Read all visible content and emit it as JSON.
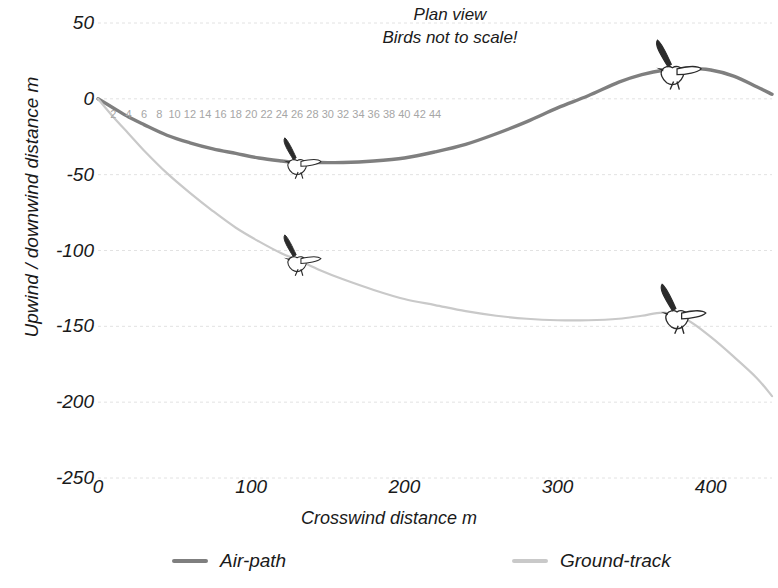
{
  "titles": {
    "line1": "Plan view",
    "line2": "Birds not to scale!"
  },
  "axes": {
    "ylabel": "Upwind / downwind distance   m",
    "xlabel": "Crosswind distance   m",
    "yticks": [
      "50",
      "0",
      "-50",
      "-100",
      "-150",
      "-200",
      "-250"
    ],
    "xticks": [
      "0",
      "100",
      "200",
      "300",
      "400"
    ],
    "secondary_xticks": [
      "2",
      "4",
      "6",
      "8",
      "10",
      "12",
      "14",
      "16",
      "18",
      "20",
      "22",
      "24",
      "26",
      "28",
      "30",
      "32",
      "34",
      "36",
      "38",
      "40",
      "42",
      "44"
    ]
  },
  "legend": {
    "air_label": "Air-path",
    "ground_label": "Ground-track"
  },
  "colors": {
    "air_path": "#7f7f7f",
    "ground_track": "#c9c9c9",
    "grid": "#e2e2e2",
    "text": "#1a1a1a",
    "secondary_tick": "#a6a6a6"
  },
  "chart_data": {
    "type": "line",
    "title": "Plan view",
    "subtitle": "Birds not to scale!",
    "xlabel": "Crosswind distance   m",
    "ylabel": "Upwind / downwind distance   m",
    "xlim": [
      0,
      440
    ],
    "ylim": [
      -250,
      50
    ],
    "xticks": [
      0,
      100,
      200,
      300,
      400
    ],
    "yticks": [
      50,
      0,
      -50,
      -100,
      -150,
      -200,
      -250
    ],
    "secondary_x_axis": {
      "label": "",
      "ticks": [
        2,
        4,
        6,
        8,
        10,
        12,
        14,
        16,
        18,
        20,
        22,
        24,
        26,
        28,
        30,
        32,
        34,
        36,
        38,
        40,
        42,
        44
      ],
      "note": "time / segment index ticks drawn inside plot near y=0"
    },
    "grid": true,
    "legend_position": "bottom",
    "series": [
      {
        "name": "Air-path",
        "color": "#7f7f7f",
        "x": [
          0,
          10,
          20,
          30,
          45,
          60,
          75,
          90,
          105,
          120,
          130,
          145,
          160,
          180,
          200,
          220,
          240,
          260,
          280,
          300,
          320,
          340,
          355,
          370,
          385,
          400,
          415,
          430,
          440
        ],
        "y": [
          0,
          -6,
          -12,
          -17,
          -24,
          -29,
          -33,
          -36,
          -39,
          -41,
          -42,
          -42,
          -42,
          -41,
          -39,
          -35,
          -30,
          -23,
          -15,
          -6,
          2,
          11,
          16,
          19,
          20,
          19,
          15,
          8,
          3
        ]
      },
      {
        "name": "Ground-track",
        "color": "#c9c9c9",
        "x": [
          0,
          10,
          20,
          30,
          45,
          60,
          75,
          90,
          105,
          120,
          130,
          145,
          160,
          180,
          200,
          220,
          240,
          260,
          280,
          300,
          320,
          340,
          355,
          370,
          385,
          400,
          415,
          430,
          440
        ],
        "y": [
          0,
          -12,
          -23,
          -34,
          -49,
          -62,
          -74,
          -85,
          -94,
          -102,
          -106,
          -113,
          -119,
          -126,
          -132,
          -136,
          -140,
          -143,
          -145,
          -146,
          -146,
          -145,
          -143,
          -141,
          -146,
          -157,
          -170,
          -184,
          -196
        ]
      }
    ],
    "annotations": [
      {
        "type": "bird-icon",
        "series": "Air-path",
        "x": 130,
        "y": -42
      },
      {
        "type": "bird-icon",
        "series": "Ground-track",
        "x": 130,
        "y": -106
      },
      {
        "type": "bird-icon",
        "series": "Air-path",
        "x": 375,
        "y": 19
      },
      {
        "type": "bird-icon",
        "series": "Ground-track",
        "x": 378,
        "y": -142
      }
    ]
  }
}
